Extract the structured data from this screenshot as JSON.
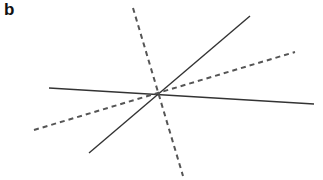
{
  "panel": {
    "label": "b"
  },
  "diagram": {
    "intersection": {
      "x": 160,
      "y": 95
    },
    "colors": {
      "solid": "#333333",
      "dashed": "#555555",
      "background": "#ffffff"
    },
    "lines": [
      {
        "name": "solid-near-horizontal-line",
        "style": "solid",
        "x1": 49,
        "y1": 88,
        "x2": 314,
        "y2": 104
      },
      {
        "name": "solid-diagonal-line",
        "style": "solid",
        "x1": 89,
        "y1": 153,
        "x2": 250,
        "y2": 16
      },
      {
        "name": "dashed-steep-line",
        "style": "dashed",
        "x1": 133,
        "y1": 8,
        "x2": 183,
        "y2": 176
      },
      {
        "name": "dashed-shallow-line",
        "style": "dashed",
        "x1": 34,
        "y1": 130,
        "x2": 295,
        "y2": 52
      }
    ]
  }
}
